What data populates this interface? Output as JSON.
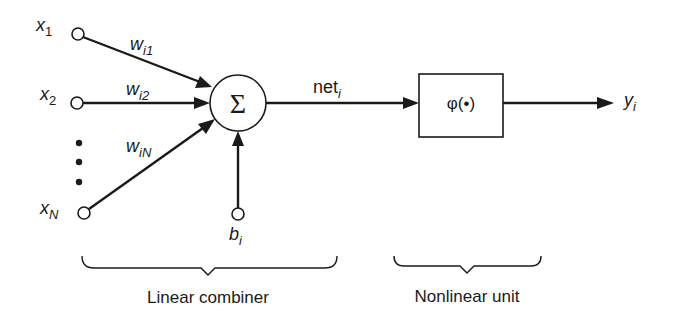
{
  "diagram": {
    "type": "artificial-neuron-model",
    "inputs": [
      {
        "var": "x",
        "sub": "1",
        "weight_var": "w",
        "weight_sub": "i1"
      },
      {
        "var": "x",
        "sub": "2",
        "weight_var": "w",
        "weight_sub": "i2"
      },
      {
        "var": "x",
        "sub": "N",
        "weight_var": "w",
        "weight_sub": "iN"
      }
    ],
    "ellipsis": "⋮",
    "summation_symbol": "Σ",
    "bias": {
      "var": "b",
      "sub": "i"
    },
    "net": {
      "var": "net",
      "sub": "i"
    },
    "activation_label": "φ(•)",
    "output": {
      "var": "y",
      "sub": "i"
    },
    "groups": [
      {
        "label": "Linear combiner"
      },
      {
        "label": "Nonlinear unit"
      }
    ],
    "colors": {
      "ink": "#1a1a1a",
      "background": "#ffffff"
    }
  }
}
